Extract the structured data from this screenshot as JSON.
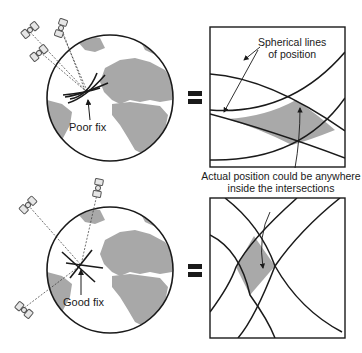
{
  "colors": {
    "ink": "#1a1a1a",
    "land": "#a8a8a8",
    "ocean": "#ffffff",
    "shaded_region": "#a9a9a9",
    "satellite_fill": "#e6e6e6"
  },
  "top_panel": {
    "fix_label": "Poor fix",
    "equals": "=",
    "annotation": "Spherical lines of position",
    "annotation_line1": "Spherical lines",
    "annotation_line2": "of position"
  },
  "middle_annotation": {
    "line1": "Actual position could be anywhere",
    "line2": "inside the intersections"
  },
  "bottom_panel": {
    "fix_label": "Good fix",
    "equals": "="
  },
  "icons": [
    "satellite-icon",
    "earth-globe-icon",
    "equals-sign-icon",
    "arrow-icon"
  ]
}
